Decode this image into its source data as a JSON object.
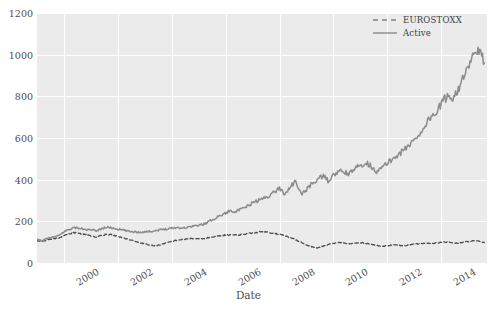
{
  "chart_data": {
    "type": "line",
    "title": "",
    "xlabel": "Date",
    "ylabel": "",
    "xlim": [
      1999.0,
      2015.7
    ],
    "ylim": [
      0,
      1200
    ],
    "grid": true,
    "legend_position": "top-right",
    "y_ticks": [
      0,
      200,
      400,
      600,
      800,
      1000,
      1200
    ],
    "y_tick_labels": [
      "0",
      "200",
      "400",
      "600",
      "800",
      "1000",
      "1200"
    ],
    "x_ticks": [
      2000,
      2002,
      2004,
      2006,
      2008,
      2010,
      2012,
      2014
    ],
    "x_tick_labels": [
      "2000",
      "2002",
      "2004",
      "2006",
      "2008",
      "2010",
      "2012",
      "2014"
    ],
    "series": [
      {
        "name": "EUROSTOXX",
        "style": "dashed",
        "color": "#4d4d4d",
        "x": [
          1999.0,
          1999.2,
          1999.4,
          1999.6,
          1999.8,
          2000.0,
          2000.2,
          2000.4,
          2000.6,
          2000.8,
          2001.0,
          2001.2,
          2001.4,
          2001.6,
          2001.8,
          2002.0,
          2002.2,
          2002.4,
          2002.6,
          2002.8,
          2003.0,
          2003.2,
          2003.4,
          2003.6,
          2003.8,
          2004.0,
          2004.2,
          2004.4,
          2004.6,
          2004.8,
          2005.0,
          2005.2,
          2005.4,
          2005.6,
          2005.8,
          2006.0,
          2006.2,
          2006.4,
          2006.6,
          2006.8,
          2007.0,
          2007.2,
          2007.4,
          2007.6,
          2007.8,
          2008.0,
          2008.2,
          2008.4,
          2008.6,
          2008.8,
          2009.0,
          2009.2,
          2009.4,
          2009.6,
          2009.8,
          2010.0,
          2010.2,
          2010.4,
          2010.6,
          2010.8,
          2011.0,
          2011.2,
          2011.4,
          2011.6,
          2011.8,
          2012.0,
          2012.2,
          2012.4,
          2012.6,
          2012.8,
          2013.0,
          2013.2,
          2013.4,
          2013.6,
          2013.8,
          2014.0,
          2014.2,
          2014.4,
          2014.6,
          2014.8,
          2015.0,
          2015.2,
          2015.4,
          2015.6
        ],
        "y": [
          108,
          104,
          112,
          116,
          120,
          132,
          140,
          146,
          142,
          136,
          130,
          126,
          133,
          138,
          134,
          127,
          120,
          113,
          106,
          98,
          92,
          86,
          82,
          88,
          96,
          104,
          110,
          113,
          116,
          118,
          115,
          118,
          122,
          126,
          131,
          134,
          136,
          133,
          137,
          141,
          145,
          148,
          150,
          147,
          143,
          138,
          130,
          122,
          112,
          100,
          86,
          78,
          72,
          80,
          88,
          94,
          98,
          96,
          92,
          95,
          97,
          95,
          90,
          84,
          80,
          84,
          87,
          85,
          83,
          86,
          90,
          93,
          95,
          93,
          96,
          99,
          101,
          98,
          96,
          99,
          103,
          108,
          104,
          98
        ]
      },
      {
        "name": "Active",
        "style": "solid",
        "color": "#8c8c8c",
        "x": [
          1999.0,
          1999.2,
          1999.4,
          1999.6,
          1999.8,
          2000.0,
          2000.2,
          2000.4,
          2000.6,
          2000.8,
          2001.0,
          2001.2,
          2001.4,
          2001.6,
          2001.8,
          2002.0,
          2002.2,
          2002.4,
          2002.6,
          2002.8,
          2003.0,
          2003.2,
          2003.4,
          2003.6,
          2003.8,
          2004.0,
          2004.2,
          2004.4,
          2004.6,
          2004.8,
          2005.0,
          2005.2,
          2005.4,
          2005.6,
          2005.8,
          2006.0,
          2006.2,
          2006.4,
          2006.6,
          2006.8,
          2007.0,
          2007.2,
          2007.4,
          2007.6,
          2007.8,
          2008.0,
          2008.2,
          2008.4,
          2008.6,
          2008.8,
          2009.0,
          2009.2,
          2009.4,
          2009.6,
          2009.8,
          2010.0,
          2010.2,
          2010.4,
          2010.6,
          2010.8,
          2011.0,
          2011.2,
          2011.4,
          2011.6,
          2011.8,
          2012.0,
          2012.2,
          2012.4,
          2012.6,
          2012.8,
          2013.0,
          2013.2,
          2013.4,
          2013.6,
          2013.8,
          2014.0,
          2014.2,
          2014.4,
          2014.6,
          2014.8,
          2015.0,
          2015.2,
          2015.4,
          2015.6
        ],
        "y": [
          112,
          108,
          118,
          124,
          130,
          150,
          162,
          170,
          166,
          160,
          158,
          155,
          165,
          172,
          168,
          162,
          158,
          152,
          150,
          148,
          150,
          152,
          155,
          160,
          164,
          168,
          170,
          168,
          172,
          178,
          180,
          188,
          200,
          215,
          228,
          240,
          252,
          248,
          258,
          272,
          288,
          300,
          310,
          322,
          340,
          360,
          330,
          368,
          390,
          330,
          352,
          380,
          400,
          418,
          396,
          420,
          440,
          436,
          428,
          452,
          470,
          482,
          465,
          440,
          455,
          480,
          500,
          520,
          540,
          565,
          590,
          620,
          660,
          700,
          720,
          760,
          800,
          790,
          830,
          880,
          930,
          1000,
          1020,
          960
        ]
      }
    ]
  },
  "legend": {
    "items": [
      {
        "label": "EUROSTOXX"
      },
      {
        "label": "Active"
      }
    ]
  },
  "axes": {
    "xlabel": "Date"
  }
}
